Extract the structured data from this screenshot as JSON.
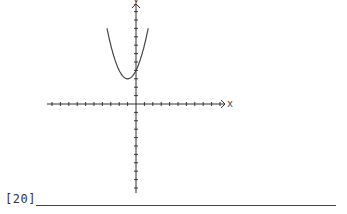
{
  "question": {
    "number_label": "[20]",
    "answer_value": ""
  },
  "graph": {
    "x_axis_label": "x",
    "y_axis_label": "y",
    "origin_px": [
      136,
      104
    ],
    "tick_spacing_px": 8.4,
    "x_ticks_left": 10,
    "x_ticks_right": 10,
    "y_ticks_up": 11,
    "y_ticks_down": 10,
    "axis_color": "#333333",
    "curve_color": "#444444"
  },
  "chart_data": {
    "type": "line",
    "title": "",
    "xlabel": "x",
    "ylabel": "y",
    "series": [
      {
        "name": "parabola",
        "equation_estimate": "y = x^2 + 2x + 4",
        "vertex": [
          -1,
          3
        ],
        "y_intercept": 4,
        "x": [
          -4,
          -3.5,
          -3,
          -2.5,
          -2,
          -1.5,
          -1,
          -0.5,
          0,
          0.5,
          1,
          1.5,
          2
        ],
        "y": [
          12,
          9.25,
          7,
          5.25,
          4,
          3.25,
          3,
          3.25,
          4,
          5.25,
          7,
          9.25,
          12
        ]
      }
    ],
    "xlim": [
      -10,
      10
    ],
    "ylim": [
      -10,
      11
    ],
    "grid": false
  }
}
